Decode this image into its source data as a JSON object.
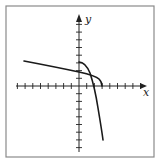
{
  "figure": {
    "axis_labels": {
      "x": "x",
      "y": "y"
    },
    "colors": {
      "frame": "#8a8a8a",
      "axes": "#222222",
      "curves": "#1a1a1a",
      "background": "#ffffff"
    }
  },
  "chart_data": {
    "type": "line",
    "title": "",
    "xlabel": "x",
    "ylabel": "y",
    "grid": false,
    "tick_labels": false,
    "xlim": [
      -8,
      8
    ],
    "ylim": [
      -8,
      8
    ],
    "unit_ticks": {
      "x": [
        -8,
        -7,
        -6,
        -5,
        -4,
        -3,
        -2,
        -1,
        1,
        2,
        3,
        4,
        5,
        6,
        7,
        8
      ],
      "y": [
        -8,
        -7,
        -6,
        -5,
        -4,
        -3,
        -2,
        -1,
        1,
        2,
        3,
        4,
        5,
        6,
        7,
        8
      ]
    },
    "series": [
      {
        "name": "curve-shallow",
        "description": "slowly decreasing curve, bends sharply down to the x-axis near x=3",
        "points": [
          [
            -7,
            3.3
          ],
          [
            -4,
            2.7
          ],
          [
            -2,
            2.2
          ],
          [
            0,
            1.8
          ],
          [
            1,
            1.5
          ],
          [
            2,
            1.1
          ],
          [
            2.5,
            0.7
          ],
          [
            3,
            0
          ]
        ]
      },
      {
        "name": "curve-steep",
        "description": "starts at y-intercept ~3, drops steeply (inverse of shallow curve)",
        "points": [
          [
            0,
            3
          ],
          [
            0.7,
            2.5
          ],
          [
            1.1,
            2
          ],
          [
            1.5,
            1.1
          ],
          [
            2,
            -1
          ],
          [
            2.5,
            -3.5
          ],
          [
            3,
            -7
          ]
        ]
      }
    ]
  }
}
